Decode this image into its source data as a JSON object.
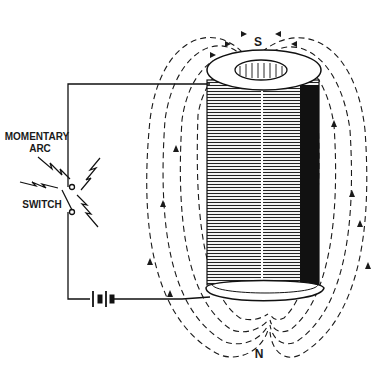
{
  "diagram": {
    "type": "electromagnet-coil-field",
    "labels": {
      "arc_line1": "MOMENTARY",
      "arc_line2": "ARC",
      "switch": "SWITCH",
      "south_pole": "S",
      "north_pole": "N"
    },
    "components": [
      "battery",
      "switch",
      "coil",
      "core",
      "magnetic-field-lines"
    ],
    "colors": {
      "ink": "#1a1a1a",
      "background": "#ffffff"
    }
  }
}
